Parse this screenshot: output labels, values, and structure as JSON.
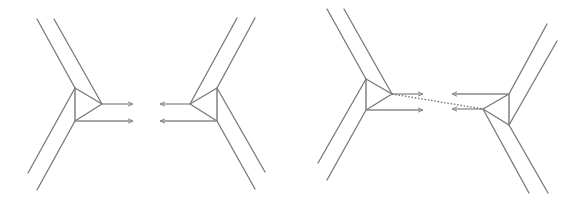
{
  "diagram": {
    "width": 577,
    "height": 203,
    "colors": {
      "line": "#7a7a7a",
      "arrow": "#8a8a8a",
      "dotted": "#6e6e6e",
      "background": "#ffffff"
    },
    "panels": [
      {
        "name": "left-panel-separated",
        "molecules": [
          {
            "name": "molecule-left",
            "triangle": [
              [
                75,
                88
              ],
              [
                102,
                104
              ],
              [
                75,
                121
              ]
            ],
            "bonds": [
              [
                [
                  75,
                  88
                ],
                [
                  37,
                  19
                ]
              ],
              [
                [
                  102,
                  104
                ],
                [
                  54,
                  19
                ]
              ],
              [
                [
                  75,
                  88
                ],
                [
                  28,
                  173
                ]
              ],
              [
                [
                  75,
                  121
                ],
                [
                  37,
                  190
                ]
              ]
            ],
            "arrows": [
              [
                [
                  102,
                  104
                ],
                [
                  133,
                  104
                ]
              ],
              [
                [
                  75,
                  121
                ],
                [
                  133,
                  121
                ]
              ]
            ]
          },
          {
            "name": "molecule-right",
            "triangle": [
              [
                190,
                104
              ],
              [
                217,
                88
              ],
              [
                217,
                121
              ]
            ],
            "bonds": [
              [
                [
                  190,
                  104
                ],
                [
                  237,
                  18
                ]
              ],
              [
                [
                  217,
                  88
                ],
                [
                  255,
                  18
                ]
              ],
              [
                [
                  217,
                  88
                ],
                [
                  265,
                  172
                ]
              ],
              [
                [
                  217,
                  121
                ],
                [
                  255,
                  189
                ]
              ]
            ],
            "arrows": [
              [
                [
                  190,
                  104
                ],
                [
                  160,
                  104
                ]
              ],
              [
                [
                  217,
                  121
                ],
                [
                  160,
                  121
                ]
              ]
            ]
          }
        ],
        "dotted_links": []
      },
      {
        "name": "right-panel-connected",
        "molecules": [
          {
            "name": "molecule-left",
            "triangle": [
              [
                366,
                79
              ],
              [
                392,
                94
              ],
              [
                366,
                110
              ]
            ],
            "bonds": [
              [
                [
                  366,
                  79
                ],
                [
                  327,
                  9
                ]
              ],
              [
                [
                  392,
                  94
                ],
                [
                  344,
                  9
                ]
              ],
              [
                [
                  366,
                  79
                ],
                [
                  318,
                  163
                ]
              ],
              [
                [
                  366,
                  110
                ],
                [
                  327,
                  180
                ]
              ]
            ],
            "arrows": [
              [
                [
                  392,
                  94
                ],
                [
                  423,
                  94
                ]
              ],
              [
                [
                  366,
                  110
                ],
                [
                  423,
                  110
                ]
              ]
            ]
          },
          {
            "name": "molecule-right",
            "triangle": [
              [
                483,
                109
              ],
              [
                509,
                94
              ],
              [
                509,
                125
              ]
            ],
            "bonds": [
              [
                [
                  509,
                  94
                ],
                [
                  547,
                  24
                ]
              ],
              [
                [
                  509,
                  125
                ],
                [
                  557,
                  41
                ]
              ],
              [
                [
                  483,
                  109
                ],
                [
                  529,
                  193
                ]
              ],
              [
                [
                  509,
                  125
                ],
                [
                  548,
                  193
                ]
              ]
            ],
            "arrows": [
              [
                [
                  509,
                  94
                ],
                [
                  452,
                  94
                ]
              ],
              [
                [
                  483,
                  109
                ],
                [
                  452,
                  109
                ]
              ]
            ]
          }
        ],
        "dotted_links": [
          [
            [
              392,
              94
            ],
            [
              483,
              109
            ]
          ]
        ]
      }
    ]
  }
}
